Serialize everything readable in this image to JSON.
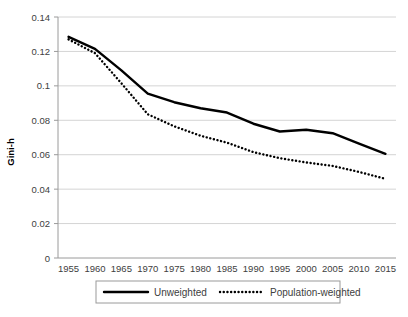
{
  "chart_data": {
    "type": "line",
    "title": "",
    "xlabel": "",
    "ylabel": "Gini-h",
    "x": [
      1955,
      1960,
      1965,
      1970,
      1975,
      1980,
      1985,
      1990,
      1995,
      2000,
      2005,
      2010,
      2015
    ],
    "xlim": [
      1953,
      2017
    ],
    "ylim": [
      0,
      0.14
    ],
    "yticks": [
      "0",
      "0.02",
      "0.04",
      "0.06",
      "0.08",
      "0.1",
      "0.12",
      "0.14"
    ],
    "ytick_values": [
      0,
      0.02,
      0.04,
      0.06,
      0.08,
      0.1,
      0.12,
      0.14
    ],
    "xticks": [
      "1955",
      "1960",
      "1965",
      "1970",
      "1975",
      "1980",
      "1985",
      "1990",
      "1995",
      "2000",
      "2005",
      "2010",
      "2015"
    ],
    "grid": "horizontal",
    "legend_position": "bottom",
    "series": [
      {
        "name": "Unweighted",
        "style": "solid",
        "color": "#000000",
        "values": [
          0.1285,
          0.1215,
          0.109,
          0.0955,
          0.0905,
          0.087,
          0.0845,
          0.078,
          0.0735,
          0.0745,
          0.0725,
          0.0665,
          0.0605
        ]
      },
      {
        "name": "Population-weighted",
        "style": "dotted",
        "color": "#000000",
        "values": [
          0.127,
          0.119,
          0.1015,
          0.0835,
          0.0765,
          0.071,
          0.067,
          0.0615,
          0.058,
          0.0555,
          0.0535,
          0.05,
          0.046
        ]
      }
    ]
  },
  "legend": {
    "items": [
      {
        "label": "Unweighted",
        "style": "solid"
      },
      {
        "label": "Population-weighted",
        "style": "dotted"
      }
    ]
  }
}
